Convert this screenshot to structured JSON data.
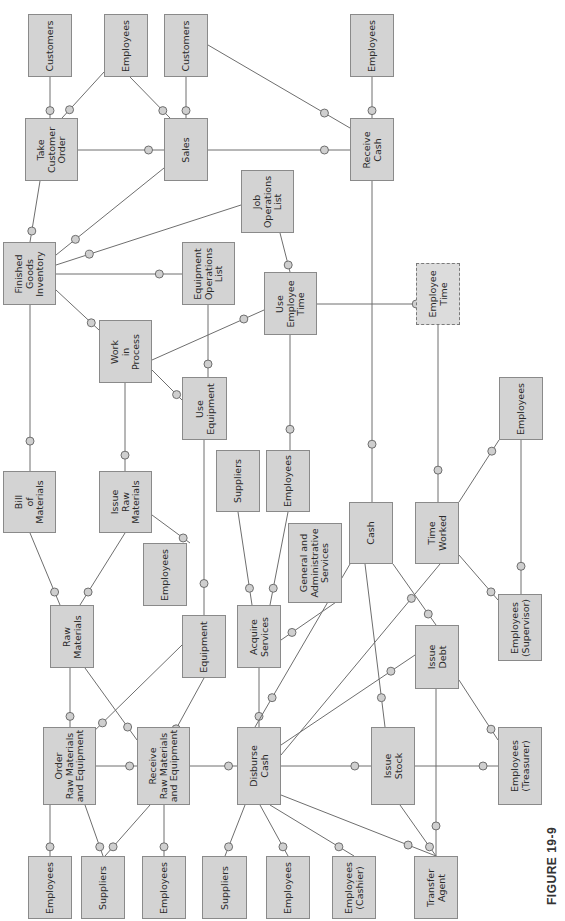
{
  "figure": {
    "label": "FIGURE 19-9"
  },
  "colors": {
    "box_fill": "#d3d3d3",
    "box_border": "#8a8a8a",
    "line": "#6e6e6e"
  },
  "entities": [
    {
      "id": "customers_1",
      "label": "Customers",
      "x": 28,
      "y": 14,
      "w": 44,
      "h": 63
    },
    {
      "id": "employees_tco",
      "label": "Employees",
      "x": 104,
      "y": 14,
      "w": 44,
      "h": 63
    },
    {
      "id": "customers_2",
      "label": "Customers",
      "x": 164,
      "y": 14,
      "w": 44,
      "h": 63
    },
    {
      "id": "employees_rc",
      "label": "Employees",
      "x": 350,
      "y": 14,
      "w": 44,
      "h": 63
    },
    {
      "id": "take_customer_order",
      "label": "Take\nCustomer\nOrder",
      "x": 25,
      "y": 118,
      "w": 53,
      "h": 63
    },
    {
      "id": "sales",
      "label": "Sales",
      "x": 164,
      "y": 118,
      "w": 44,
      "h": 63
    },
    {
      "id": "receive_cash",
      "label": "Receive\nCash",
      "x": 350,
      "y": 118,
      "w": 44,
      "h": 63
    },
    {
      "id": "job_operations_list",
      "label": "Job\nOperations\nList",
      "x": 241,
      "y": 170,
      "w": 53,
      "h": 63
    },
    {
      "id": "finished_goods_inventory",
      "label": "Finished\nGoods\nInventory",
      "x": 3,
      "y": 242,
      "w": 53,
      "h": 63
    },
    {
      "id": "equipment_operations_list",
      "label": "Equipment\nOperations\nList",
      "x": 182,
      "y": 242,
      "w": 53,
      "h": 63
    },
    {
      "id": "use_employee_time",
      "label": "Use\nEmployee\nTime",
      "x": 264,
      "y": 272,
      "w": 53,
      "h": 63
    },
    {
      "id": "employee_time",
      "label": "Employee\nTime",
      "x": 416,
      "y": 263,
      "w": 44,
      "h": 62,
      "dashed": true
    },
    {
      "id": "work_in_process",
      "label": "Work\nin\nProcess",
      "x": 99,
      "y": 320,
      "w": 53,
      "h": 63
    },
    {
      "id": "use_equipment",
      "label": "Use\nEquipment",
      "x": 182,
      "y": 377,
      "w": 45,
      "h": 63
    },
    {
      "id": "employees_tw",
      "label": "Employees",
      "x": 499,
      "y": 377,
      "w": 44,
      "h": 63
    },
    {
      "id": "suppliers_as",
      "label": "Suppliers",
      "x": 216,
      "y": 450,
      "w": 44,
      "h": 62
    },
    {
      "id": "employees_as",
      "label": "Employees",
      "x": 266,
      "y": 450,
      "w": 44,
      "h": 62
    },
    {
      "id": "bill_of_materials",
      "label": "Bill\nof\nMaterials",
      "x": 3,
      "y": 471,
      "w": 53,
      "h": 62
    },
    {
      "id": "issue_raw_materials",
      "label": "Issue\nRaw\nMaterials",
      "x": 99,
      "y": 471,
      "w": 53,
      "h": 62
    },
    {
      "id": "cash",
      "label": "Cash",
      "x": 349,
      "y": 502,
      "w": 44,
      "h": 62
    },
    {
      "id": "time_worked",
      "label": "Time\nWorked",
      "x": 415,
      "y": 502,
      "w": 44,
      "h": 62
    },
    {
      "id": "ga_services",
      "label": "General and\nAdministrative\nServices",
      "x": 288,
      "y": 523,
      "w": 54,
      "h": 80
    },
    {
      "id": "employees_irm",
      "label": "Employees",
      "x": 143,
      "y": 543,
      "w": 44,
      "h": 63
    },
    {
      "id": "raw_materials",
      "label": "Raw\nMaterials",
      "x": 50,
      "y": 605,
      "w": 44,
      "h": 63
    },
    {
      "id": "acquire_services",
      "label": "Acquire\nServices",
      "x": 237,
      "y": 605,
      "w": 44,
      "h": 63
    },
    {
      "id": "equipment",
      "label": "Equipment",
      "x": 182,
      "y": 615,
      "w": 44,
      "h": 63
    },
    {
      "id": "employees_supervisor",
      "label": "Employees\n(Supervisor)",
      "x": 498,
      "y": 594,
      "w": 44,
      "h": 67
    },
    {
      "id": "issue_debt",
      "label": "Issue\nDebt",
      "x": 415,
      "y": 625,
      "w": 44,
      "h": 64
    },
    {
      "id": "order_rme",
      "label": "Order\nRaw Materials\nand Equipment",
      "x": 43,
      "y": 727,
      "w": 53,
      "h": 78
    },
    {
      "id": "receive_rme",
      "label": "Receive\nRaw Materials\nand Equipment",
      "x": 137,
      "y": 727,
      "w": 53,
      "h": 78
    },
    {
      "id": "disburse_cash",
      "label": "Disburse\nCash",
      "x": 237,
      "y": 727,
      "w": 44,
      "h": 78
    },
    {
      "id": "issue_stock",
      "label": "Issue\nStock",
      "x": 371,
      "y": 727,
      "w": 44,
      "h": 78
    },
    {
      "id": "employees_treasurer",
      "label": "Employees\n(Treasurer)",
      "x": 498,
      "y": 727,
      "w": 44,
      "h": 78
    },
    {
      "id": "employees_b1",
      "label": "Employees",
      "x": 28,
      "y": 856,
      "w": 44,
      "h": 63
    },
    {
      "id": "suppliers_b1",
      "label": "Suppliers",
      "x": 81,
      "y": 856,
      "w": 44,
      "h": 63
    },
    {
      "id": "employees_b2",
      "label": "Employees",
      "x": 142,
      "y": 856,
      "w": 44,
      "h": 63
    },
    {
      "id": "suppliers_b2",
      "label": "Suppliers",
      "x": 202,
      "y": 856,
      "w": 45,
      "h": 63
    },
    {
      "id": "employees_b3",
      "label": "Employees",
      "x": 266,
      "y": 856,
      "w": 44,
      "h": 63
    },
    {
      "id": "employees_cashier",
      "label": "Employees\n(Cashier)",
      "x": 332,
      "y": 856,
      "w": 44,
      "h": 63
    },
    {
      "id": "transfer_agent",
      "label": "Transfer\nAgent",
      "x": 414,
      "y": 856,
      "w": 44,
      "h": 63
    }
  ],
  "relationships": [
    [
      50,
      77,
      50,
      118
    ],
    [
      104,
      72,
      62,
      118
    ],
    [
      130,
      77,
      170,
      118
    ],
    [
      186,
      77,
      186,
      118
    ],
    [
      78,
      150,
      164,
      150
    ],
    [
      208,
      150,
      350,
      150
    ],
    [
      372,
      77,
      372,
      118
    ],
    [
      208,
      45,
      350,
      128
    ],
    [
      372,
      181,
      372,
      502
    ],
    [
      40,
      181,
      30,
      242
    ],
    [
      164,
      168,
      56,
      255
    ],
    [
      241,
      205,
      56,
      265
    ],
    [
      56,
      274,
      182,
      274
    ],
    [
      56,
      290,
      99,
      330
    ],
    [
      208,
      305,
      208,
      377
    ],
    [
      152,
      360,
      264,
      310
    ],
    [
      152,
      370,
      182,
      400
    ],
    [
      280,
      233,
      290,
      272
    ],
    [
      290,
      335,
      290,
      450
    ],
    [
      317,
      304,
      438,
      304
    ],
    [
      438,
      325,
      438,
      502
    ],
    [
      30,
      305,
      30,
      471
    ],
    [
      125,
      383,
      125,
      471
    ],
    [
      152,
      515,
      190,
      543
    ],
    [
      30,
      533,
      60,
      605
    ],
    [
      125,
      533,
      80,
      605
    ],
    [
      204,
      440,
      204,
      615
    ],
    [
      238,
      512,
      252,
      605
    ],
    [
      288,
      512,
      270,
      605
    ],
    [
      342,
      598,
      281,
      640
    ],
    [
      70,
      668,
      70,
      727
    ],
    [
      85,
      668,
      137,
      740
    ],
    [
      182,
      645,
      85,
      740
    ],
    [
      204,
      678,
      170,
      740
    ],
    [
      96,
      766,
      137,
      766
    ],
    [
      190,
      766,
      237,
      766
    ],
    [
      259,
      668,
      259,
      727
    ],
    [
      50,
      805,
      50,
      856
    ],
    [
      85,
      805,
      103,
      856
    ],
    [
      150,
      805,
      105,
      856
    ],
    [
      164,
      805,
      164,
      856
    ],
    [
      245,
      805,
      225,
      856
    ],
    [
      260,
      805,
      288,
      856
    ],
    [
      270,
      805,
      354,
      856
    ],
    [
      281,
      795,
      436,
      856
    ],
    [
      281,
      766,
      371,
      766
    ],
    [
      350,
      564,
      255,
      727
    ],
    [
      365,
      564,
      385,
      727
    ],
    [
      393,
      564,
      436,
      625
    ],
    [
      281,
      755,
      440,
      564
    ],
    [
      281,
      745,
      415,
      655
    ],
    [
      415,
      766,
      498,
      766
    ],
    [
      436,
      689,
      436,
      856
    ],
    [
      400,
      805,
      436,
      856
    ],
    [
      459,
      680,
      498,
      740
    ],
    [
      459,
      555,
      498,
      600
    ],
    [
      459,
      502,
      499,
      440
    ],
    [
      521,
      440,
      521,
      594
    ]
  ],
  "dashed_relationships": [
    [
      317,
      304,
      416,
      304
    ],
    [
      438,
      325,
      438,
      502
    ]
  ]
}
